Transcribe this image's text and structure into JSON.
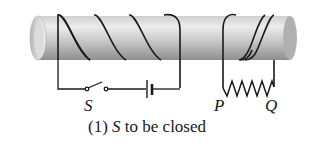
{
  "diagram": {
    "type": "circuit-solenoid",
    "labels": {
      "switch": "S",
      "resistor_left": "P",
      "resistor_right": "Q"
    },
    "caption": {
      "number": "(1)",
      "symbol": "S",
      "text": "to be closed"
    },
    "components": [
      {
        "name": "tube",
        "kind": "hollow cylinder"
      },
      {
        "name": "primary-coil",
        "turns": 3
      },
      {
        "name": "secondary-coil",
        "turns": 2
      },
      {
        "name": "switch",
        "label": "S",
        "state": "open"
      },
      {
        "name": "battery"
      },
      {
        "name": "resistor",
        "ends": [
          "P",
          "Q"
        ]
      }
    ],
    "colors": {
      "tube_light": "#e6e6e6",
      "tube_dark": "#9a9a9a",
      "wire": "#1a1a1a"
    }
  }
}
